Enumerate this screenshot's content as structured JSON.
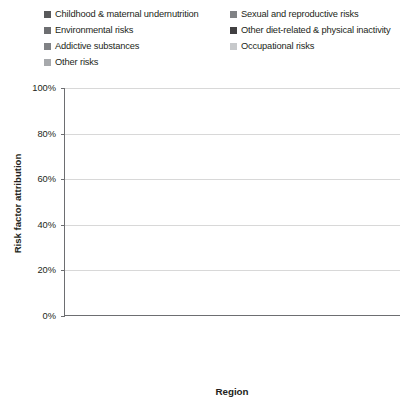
{
  "chart_data": {
    "type": "bar",
    "subtype": "stacked-100-percent",
    "title": "",
    "xlabel": "Region",
    "ylabel": "Risk factor attribution",
    "ylim": [
      0,
      100
    ],
    "yticks": [
      "0%",
      "20%",
      "40%",
      "60%",
      "80%",
      "100%"
    ],
    "ytick_values": [
      0,
      20,
      40,
      60,
      80,
      100
    ],
    "grid": true,
    "legend_position": "top",
    "legend_columns": 2,
    "categories": [
      "Africa",
      "Eastern Mediterranean",
      "Southeast Asia",
      "Western Pacific",
      "Americas",
      "Europe",
      "World"
    ],
    "category_gap_before": "World",
    "series": [
      {
        "name": "Childhood & maternal undernutrition",
        "color": "#58595b",
        "values": [
          44,
          39,
          31,
          6,
          5,
          3,
          20
        ]
      },
      {
        "name": "Sexual and reproductive risks",
        "color": "#bcbec0",
        "values": [
          6,
          5,
          5,
          7,
          5,
          2,
          5
        ]
      },
      {
        "name": "Environmental risks",
        "color": "#a7a9ac",
        "values": [
          24,
          18,
          15,
          13,
          47,
          56,
          21
        ]
      },
      {
        "name": "Other diet-related & physical inactivity",
        "color": "#414042",
        "values": [
          8,
          26,
          32,
          26,
          9,
          6,
          12
        ]
      },
      {
        "name": "Addictive substances",
        "color": "#808285",
        "values": [
          4,
          3,
          5,
          36,
          24,
          26,
          28
        ]
      },
      {
        "name": "Occupational risks",
        "color": "#d1d3d4",
        "values": [
          2,
          2,
          3,
          2,
          2,
          2,
          2
        ]
      },
      {
        "name": "Other risks",
        "color": "#939598",
        "values": [
          12,
          7,
          9,
          10,
          8,
          5,
          12
        ]
      }
    ]
  },
  "legend": {
    "items": [
      {
        "label": "Childhood & maternal undernutrition",
        "color": "#58595b"
      },
      {
        "label": "Sexual and reproductive risks",
        "color": "#808285"
      },
      {
        "label": "Environmental risks",
        "color": "#6d6e71"
      },
      {
        "label": "Other diet-related & physical inactivity",
        "color": "#414042"
      },
      {
        "label": "Addictive substances",
        "color": "#808285"
      },
      {
        "label": "Occupational risks",
        "color": "#c7c9cb"
      },
      {
        "label": "Other risks",
        "color": "#a7a9ac"
      }
    ]
  }
}
